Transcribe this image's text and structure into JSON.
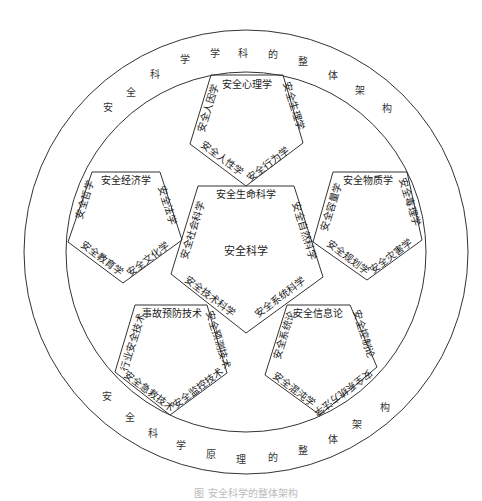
{
  "diagram": {
    "outer_ring": {
      "top_text": [
        "安",
        "全",
        "科",
        "学",
        "学",
        "科",
        "的",
        "整",
        "体",
        "架",
        "构"
      ],
      "bottom_text": [
        "安",
        "全",
        "科",
        "学",
        "原",
        "理",
        "的",
        "整",
        "体",
        "架",
        "构"
      ]
    },
    "center_label": "安全科学",
    "pentagons": {
      "center": {
        "top": "安全生命科学",
        "upper_left": "安全社会科学",
        "upper_right": "安全自然科学",
        "lower_left": "安全技术科学",
        "lower_right": "安全系统科学"
      },
      "top": {
        "top": "安全心理学",
        "upper_left": "安全人因学",
        "upper_right": "安全生理学",
        "lower_left": "安全人性学",
        "lower_right": "安全行为学"
      },
      "left": {
        "top": "安全经济学",
        "upper_left": "安全哲学",
        "upper_right": "安全法学",
        "lower_left": "安全教育学",
        "lower_right": "安全文化学"
      },
      "right": {
        "top": "安全物质学",
        "upper_left": "安全容量学",
        "upper_right": "安全毒理学",
        "lower_left": "安全规划学",
        "lower_right": "安全灾害学"
      },
      "bottom_left": {
        "top": "事故预防技术",
        "upper_left": "行业安全技术",
        "upper_right": "安全预测技术",
        "lower_left": "安全急救技术",
        "lower_right": "安全监控技术"
      },
      "bottom_right": {
        "top": "安全信息论",
        "upper_left": "安全系统论",
        "upper_right": "安全控制论",
        "lower_left": "安全混沌学",
        "lower_right": "安全系统方法学"
      }
    },
    "caption": "图 安全科学的整体架构"
  }
}
